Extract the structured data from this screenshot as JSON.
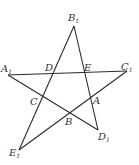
{
  "diagram": {
    "type": "pentagram",
    "outer_vertices": [
      {
        "name": "A",
        "sub": "1",
        "x": 8,
        "y": 75
      },
      {
        "name": "B",
        "sub": "1",
        "x": 74,
        "y": 26
      },
      {
        "name": "C",
        "sub": "1",
        "x": 127,
        "y": 71
      },
      {
        "name": "D",
        "sub": "1",
        "x": 98,
        "y": 130
      },
      {
        "name": "E",
        "sub": "1",
        "x": 19,
        "y": 150
      }
    ],
    "inner_points": [
      {
        "name": "D",
        "x": 53,
        "y": 73
      },
      {
        "name": "E",
        "x": 86,
        "y": 73
      },
      {
        "name": "C",
        "x": 42,
        "y": 97
      },
      {
        "name": "A",
        "x": 91,
        "y": 97
      },
      {
        "name": "B",
        "x": 69,
        "y": 113
      }
    ],
    "labels": {
      "A1": {
        "text": "A",
        "sub": "1"
      },
      "B1": {
        "text": "B",
        "sub": "1"
      },
      "C1": {
        "text": "C",
        "sub": "1"
      },
      "D1": {
        "text": "D",
        "sub": "1"
      },
      "E1": {
        "text": "E",
        "sub": "1"
      },
      "D": "D",
      "E": "E",
      "C": "C",
      "A": "A",
      "B": "B"
    },
    "segments": [
      [
        "A1",
        "C1"
      ],
      [
        "C1",
        "E1"
      ],
      [
        "E1",
        "B1"
      ],
      [
        "B1",
        "D1"
      ],
      [
        "D1",
        "A1"
      ]
    ]
  }
}
